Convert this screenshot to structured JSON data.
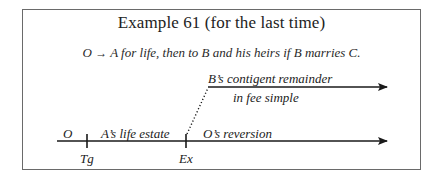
{
  "title": "Example 61 (for the last time)",
  "conveyance": {
    "grantor": "O",
    "arrow": "→",
    "text": "A for life, then to B and his heirs if B marries C."
  },
  "diagram": {
    "upper_arrow": {
      "label_line1": "B’s contigent remainder",
      "label_line2": "in fee simple"
    },
    "timeline": {
      "start_label": "O",
      "segment1_label": "A’s life estate",
      "segment2_label": "O’s reversion",
      "tick1_label": "Tg",
      "tick2_label": "Ex"
    },
    "colors": {
      "line": "#1a1a1a",
      "border": "#6a6a6a",
      "text": "#222222"
    }
  }
}
